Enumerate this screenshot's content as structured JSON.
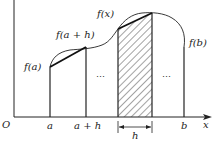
{
  "diagram": {
    "labels": {
      "origin": "O",
      "x_axis": "x",
      "a": "a",
      "a_plus_h": "a + h",
      "b": "b",
      "h": "h",
      "f_a": "f(a)",
      "f_a_plus_h": "f(a + h)",
      "f_x": "f(x)",
      "f_b": "f(b)",
      "ellipsis_left": "…",
      "ellipsis_right": "…"
    },
    "colors": {
      "stroke": "#222222",
      "background": "#ffffff",
      "hatch": "#333333"
    }
  }
}
